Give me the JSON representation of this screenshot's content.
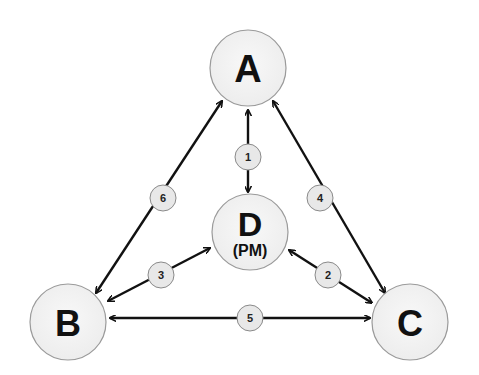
{
  "diagram": {
    "colors": {
      "node_fill": "#f2f2f2",
      "node_stroke": "#9a9a9a",
      "edge": "#111111",
      "badge_fill": "#e6e6e6",
      "badge_stroke": "#8a8a8a",
      "text": "#111111"
    },
    "nodes": [
      {
        "id": "A",
        "label": "A",
        "sublabel": ""
      },
      {
        "id": "B",
        "label": "B",
        "sublabel": ""
      },
      {
        "id": "C",
        "label": "C",
        "sublabel": ""
      },
      {
        "id": "D",
        "label": "D",
        "sublabel": "(PM)"
      }
    ],
    "edges": [
      {
        "id": "1",
        "label": "1",
        "from": "A",
        "to": "D",
        "bidirectional": true
      },
      {
        "id": "2",
        "label": "2",
        "from": "D",
        "to": "C",
        "bidirectional": true
      },
      {
        "id": "3",
        "label": "3",
        "from": "D",
        "to": "B",
        "bidirectional": true
      },
      {
        "id": "4",
        "label": "4",
        "from": "A",
        "to": "C",
        "bidirectional": true
      },
      {
        "id": "5",
        "label": "5",
        "from": "B",
        "to": "C",
        "bidirectional": true
      },
      {
        "id": "6",
        "label": "6",
        "from": "A",
        "to": "B",
        "bidirectional": true
      }
    ]
  }
}
